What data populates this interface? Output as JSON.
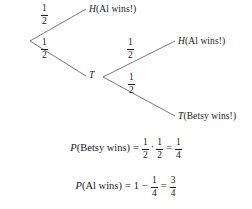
{
  "figure": {
    "type": "probability-tree-diagram"
  },
  "tree": {
    "root": {
      "label": ""
    },
    "branches": [
      {
        "id": "root-to-h",
        "probability": {
          "numerator": "1",
          "denominator": "2"
        },
        "outcome": {
          "symbol": "H",
          "text": "(Al wins!)"
        }
      },
      {
        "id": "root-to-t",
        "probability": {
          "numerator": "1",
          "denominator": "2"
        },
        "outcome": {
          "symbol": "T",
          "text": ""
        }
      },
      {
        "id": "t-to-h",
        "probability": {
          "numerator": "1",
          "denominator": "2"
        },
        "outcome": {
          "symbol": "H",
          "text": "(Al wins!)"
        }
      },
      {
        "id": "t-to-t",
        "probability": {
          "numerator": "1",
          "denominator": "2"
        },
        "outcome": {
          "symbol": "T",
          "text": "(Betsy wins!)"
        }
      }
    ]
  },
  "equations": {
    "betsy": {
      "function": "P",
      "argument": "(Betsy wins)",
      "equals": "=",
      "term1": {
        "numerator": "1",
        "denominator": "2"
      },
      "operator": "·",
      "term2": {
        "numerator": "1",
        "denominator": "2"
      },
      "equals2": "=",
      "result": {
        "numerator": "1",
        "denominator": "4"
      }
    },
    "al": {
      "function": "P",
      "argument": "(Al wins)",
      "equals": "=",
      "term1": "1",
      "operator": "−",
      "term2": {
        "numerator": "1",
        "denominator": "4"
      },
      "equals2": "=",
      "result": {
        "numerator": "3",
        "denominator": "4"
      }
    }
  },
  "colors": {
    "line": "#6b6b6b",
    "text": "#1a1a1a",
    "background": "#ffffff"
  }
}
